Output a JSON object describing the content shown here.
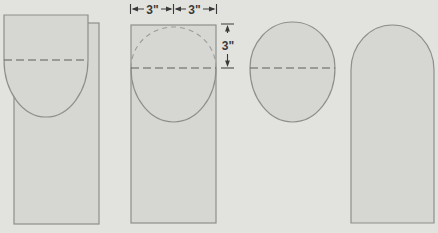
{
  "labels": {
    "dim_width_left": "3\"",
    "dim_width_right": "3\"",
    "dim_height": "3\""
  },
  "figures": [
    {
      "name": "squared-oval-template-over-board",
      "step": 1
    },
    {
      "name": "circle-and-oval-layout-on-board",
      "step": 2
    },
    {
      "name": "oval-template-with-centerline",
      "step": 3
    },
    {
      "name": "finished-round-top-board",
      "step": 4
    }
  ],
  "colors": {
    "background": "#e2e3de",
    "shape_fill": "#d6d7d2",
    "outline": "#8e8f8b",
    "dash_dark": "#5f5f5d",
    "dash_light": "#9c9c9a",
    "ink": "#3a3a3a"
  }
}
